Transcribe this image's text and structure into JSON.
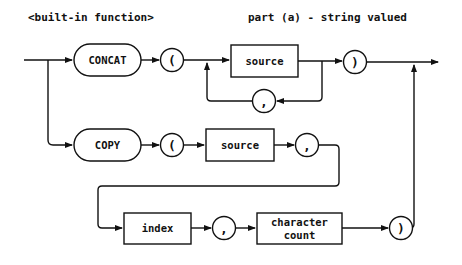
{
  "header": {
    "left_title": "<built-in function>",
    "right_title": "part (a) - string valued"
  },
  "diagram": {
    "type": "syntax-railroad",
    "branches": [
      {
        "name": "concat",
        "keyword": "CONCAT",
        "open_paren": "(",
        "argument": "source",
        "repeat_separator": ",",
        "close_paren": ")"
      },
      {
        "name": "copy",
        "keyword": "COPY",
        "open_paren": "(",
        "arg1": "source",
        "sep1": ",",
        "arg2": "index",
        "sep2": ",",
        "arg3_line1": "character",
        "arg3_line2": "count",
        "close_paren": ")"
      }
    ]
  }
}
